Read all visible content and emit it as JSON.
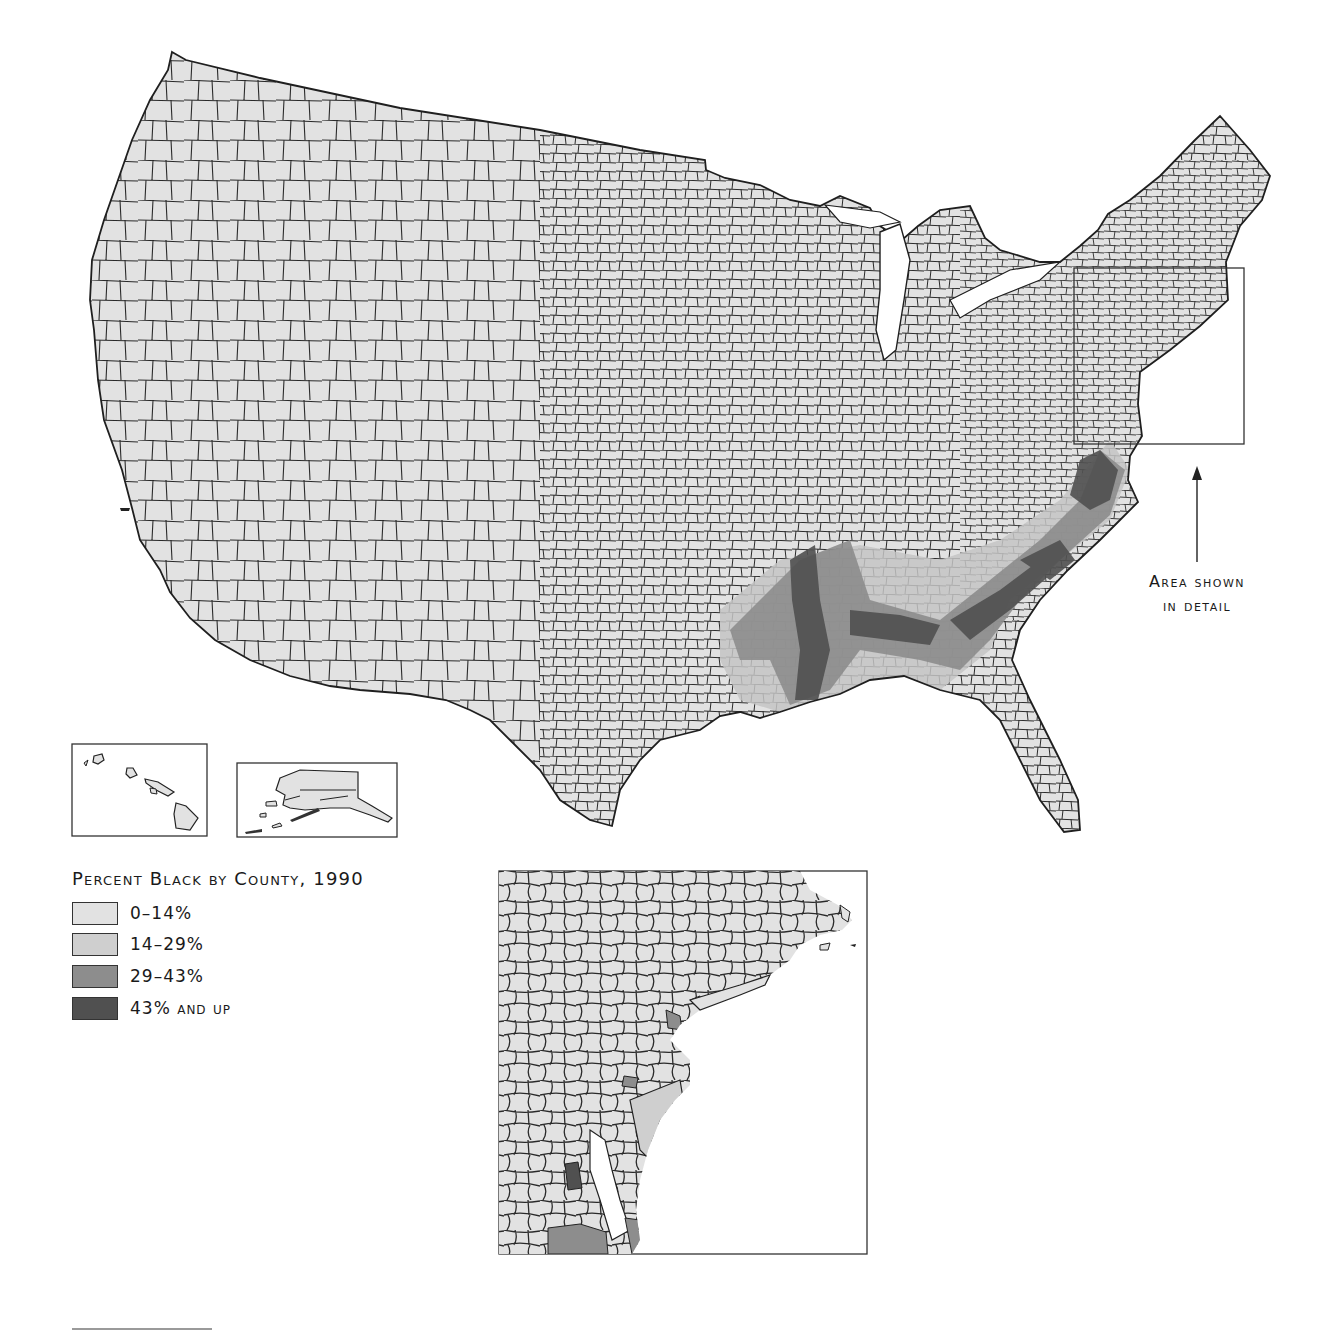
{
  "map": {
    "title": "Percent Black by County, 1990",
    "region": "Contiguous United States with Alaska and Hawaii insets",
    "colors": {
      "background": "#ffffff",
      "outline": "#1f1f1f",
      "class_0_14": "#e2e2e2",
      "class_14_29": "#c4c4c4",
      "class_29_43": "#8d8d8d",
      "class_43_up": "#505050"
    }
  },
  "legend": {
    "title": "Percent Black by County, 1990",
    "items": [
      {
        "label": "0–14%",
        "color": "#e2e2e2"
      },
      {
        "label": "14–29%",
        "color": "#cfcfcf"
      },
      {
        "label": "29–43%",
        "color": "#8d8d8d"
      },
      {
        "label": "43% and up",
        "color": "#505050"
      }
    ]
  },
  "annotation": {
    "line1": "Area shown",
    "line2": "in detail"
  },
  "insets": {
    "hawaii": "Hawaii inset",
    "alaska": "Alaska inset",
    "detail": "Northeast detail inset"
  }
}
